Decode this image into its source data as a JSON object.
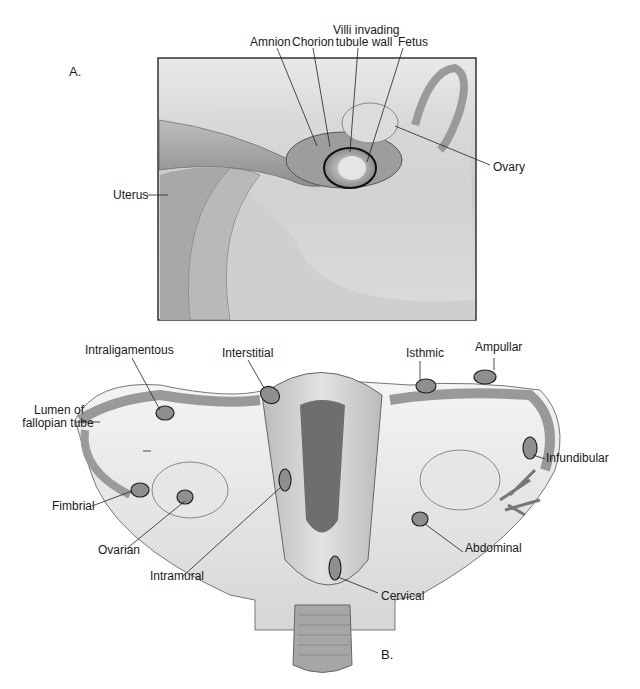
{
  "figure": {
    "panel_a": {
      "letter": "A.",
      "labels": {
        "amnion": "Amnion",
        "chorion": "Chorion",
        "villi_line1": "Villi invading",
        "villi_line2": "tubule wall",
        "fetus": "Fetus",
        "ovary": "Ovary",
        "uterus": "Uterus"
      }
    },
    "panel_b": {
      "letter": "B.",
      "labels": {
        "intraligamentous": "Intraligamentous",
        "interstitial": "Interstitial",
        "isthmic": "Isthmic",
        "ampullar": "Ampullar",
        "lumen_line1": "Lumen of",
        "lumen_line2": "fallopian tube",
        "infundibular": "Infundibular",
        "fimbrial": "Fimbrial",
        "ovarian": "Ovarian",
        "intramural": "Intramural",
        "abdominal": "Abdominal",
        "cervical": "Cervical"
      }
    }
  }
}
